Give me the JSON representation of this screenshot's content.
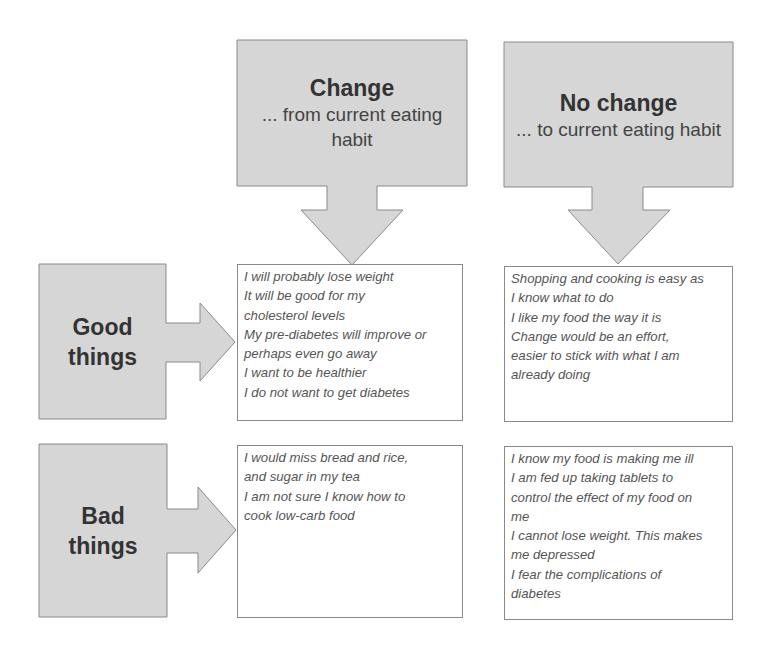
{
  "diagram": {
    "colors": {
      "box_fill": "#d6d6d6",
      "box_border": "#8a8a8a",
      "text_box_fill": "#ffffff",
      "text": "#555555"
    },
    "columns": [
      {
        "title": "Change",
        "subtitle": "... from current eating habit"
      },
      {
        "title": "No change",
        "subtitle": "... to current eating habit"
      }
    ],
    "rows": [
      {
        "title_line1": "Good",
        "title_line2": "things"
      },
      {
        "title_line1": "Bad",
        "title_line2": "things"
      }
    ],
    "cells": {
      "change_good": [
        "I will probably lose weight",
        "It will be good for my",
        "cholesterol levels",
        "My pre-diabetes will improve or",
        "perhaps even go away",
        "I want to be healthier",
        "I do not want to get diabetes"
      ],
      "nochange_good": [
        "Shopping and cooking is easy as",
        "I know what to do",
        "I like my food the way it is",
        "Change would be an effort,",
        "easier to stick with what I am",
        "already doing"
      ],
      "change_bad": [
        "I would miss bread and rice,",
        "and sugar in my tea",
        "I am not sure I know how to",
        "cook low-carb food"
      ],
      "nochange_bad": [
        "I know my food is making me ill",
        "I am fed up taking tablets to",
        "control the effect of my food on",
        "me",
        "I cannot lose weight. This makes",
        "me depressed",
        "I fear the complications of",
        "diabetes"
      ]
    }
  }
}
